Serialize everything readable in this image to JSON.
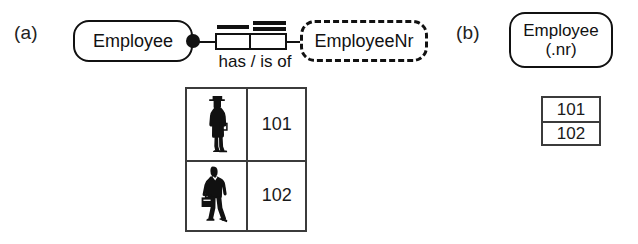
{
  "diagram": {
    "colors": {
      "ink": "#111111",
      "table_border": "#3b3b3b",
      "background": "#ffffff"
    }
  },
  "panel_a": {
    "label": "(a)",
    "entity": {
      "label": "Employee",
      "border_style": "solid"
    },
    "value_type": {
      "label": "EmployeeNr",
      "border_style": "dashed"
    },
    "predicate": {
      "reading": "has / is of"
    },
    "constraints": {
      "mandatory_role": "filled-dot",
      "uniqueness_left": "single-bar",
      "uniqueness_right": "double-bar"
    },
    "population_table": {
      "columns": [
        "Employee",
        "EmployeeNr"
      ],
      "rows": [
        {
          "figure": "person-standing-icon",
          "value": "101"
        },
        {
          "figure": "person-briefcase-icon",
          "value": "102"
        }
      ]
    }
  },
  "panel_b": {
    "label": "(b)",
    "entity": {
      "label": "Employee\n(.nr)",
      "border_style": "solid"
    },
    "population_table": {
      "columns": [
        "EmployeeNr"
      ],
      "rows": [
        {
          "value": "101"
        },
        {
          "value": "102"
        }
      ]
    }
  }
}
